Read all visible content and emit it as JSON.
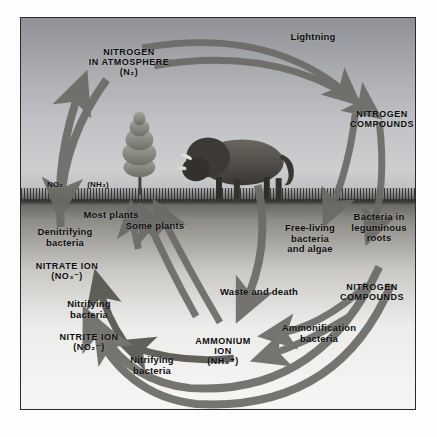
{
  "diagram": {
    "frame_color": "#2a2a2a",
    "sky_color": "#a9abaf",
    "soil_color": "#c9c8c4",
    "arrow_color": "#6b6a66",
    "text_color": "#0d0d0d"
  },
  "atmosphere": {
    "nitrogen_pool": "NITROGEN\nIN ATMOSPHERE\n(N₂)",
    "lightning": "Lightning",
    "nitrogen_compounds": "NITROGEN\nCOMPOUNDS",
    "no2": "NO₂",
    "nh3": "(NH₃)"
  },
  "illustration": {
    "tree": "conifer-tree",
    "animal": "bison"
  },
  "soil_labels": {
    "most_plants": "Most plants",
    "some_plants": "Some plants",
    "denitrifying_bacteria": "Denitrifying\nbacteria",
    "nitrate_ion": "NITRATE ION\n(NO₃⁻)",
    "nitrifying_bacteria_upper": "Nitrifying\nbacteria",
    "nitrite_ion": "NITRITE ION\n(NO₂⁻)",
    "nitrifying_bacteria_lower": "Nitrifying\nbacteria",
    "ammonium_ion": "AMMONIUM\nION\n(NH₄⁺)",
    "free_living_bacteria": "Free-living\nbacteria\nand algae",
    "bacteria_leguminous_roots": "Bacteria in\nleguminous\nroots",
    "waste_and_death": "Waste and death",
    "ammonification_bacteria": "Ammonification\nbacteria",
    "nitrogen_compounds_soil": "NITROGEN\nCOMPOUNDS"
  }
}
